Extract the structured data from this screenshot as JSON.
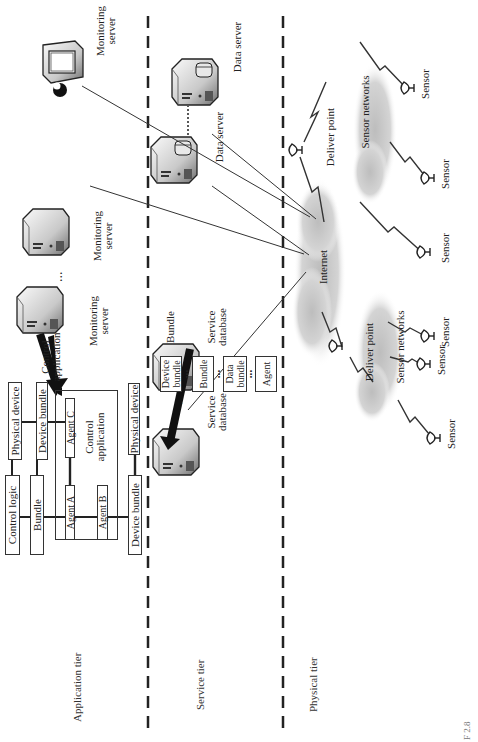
{
  "diagram": {
    "orientation": "rotated 90 degrees counter-clockwise",
    "tiers": [
      {
        "id": "application",
        "label": "Application tier"
      },
      {
        "id": "service",
        "label": "Service tier"
      },
      {
        "id": "physical",
        "label": "Physical tier"
      }
    ],
    "application_tier": {
      "control_logic": "Control logic",
      "bundle": "Bundle",
      "physical_device_top": "Physical device",
      "device_bundle_top": "Device bundle",
      "control_application_box": "Control application",
      "agent_a": "Agent A",
      "agent_b": "Agent B",
      "agent_c": "Agent C",
      "device_bundle_bottom": "Device bundle",
      "physical_device_bottom": "Physical device",
      "control_application_label": "Control application",
      "monitoring_servers": [
        {
          "label": "Monitoring server"
        },
        {
          "label": "Monitoring server"
        },
        {
          "label": "Monitoring server"
        }
      ],
      "ellipsis": "..."
    },
    "service_tier": {
      "service_databases": [
        {
          "label": "Service database"
        },
        {
          "label": "Service database"
        }
      ],
      "data_servers": [
        {
          "label": "Data server"
        },
        {
          "label": "Data server"
        }
      ],
      "bundle_arrow_label": "Bundle",
      "bundle_stack": [
        {
          "label": "Device bundle"
        },
        {
          "label": "Bundle"
        },
        {
          "label": "Data bundle"
        },
        {
          "label": "Agent"
        }
      ],
      "stack_separator": "•••",
      "ellipsis": "..."
    },
    "physical_tier": {
      "internet": "Internet",
      "deliver_points": [
        {
          "label": "Deliver point"
        },
        {
          "label": "Deliver point"
        }
      ],
      "sensor_networks": [
        {
          "label": "Sensor networks"
        },
        {
          "label": "Sensor networks"
        }
      ],
      "sensors": [
        {
          "label": "Sensor"
        },
        {
          "label": "Sensor"
        },
        {
          "label": "Sensor"
        },
        {
          "label": "Sensor"
        },
        {
          "label": "Sensor"
        },
        {
          "label": "Sensor"
        }
      ]
    },
    "caption_fragment": "F 2.8",
    "colors": {
      "line": "#333333",
      "cloud": "#c8c8c8",
      "server_light": "#f2f2f2",
      "server_dark": "#8a8a8a"
    }
  }
}
